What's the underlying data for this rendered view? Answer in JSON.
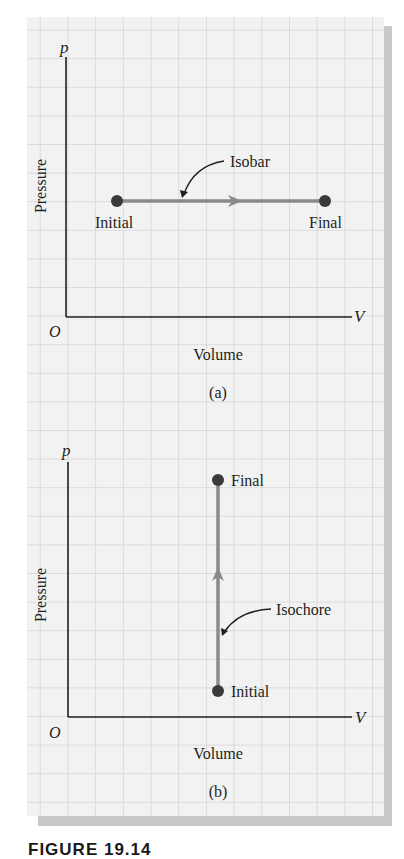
{
  "figure": {
    "caption_partial": "FIGURE 19.14",
    "colors": {
      "paper": "#f2f2f2",
      "grid": "#c8c8c8",
      "shadow": "#c9c9c9",
      "axis": "#231f20",
      "process_line": "#8a8a8a",
      "point": "#3a3a3a"
    }
  },
  "panels": [
    {
      "id": "a",
      "label": "(a)",
      "y_axis_symbol": "p",
      "x_axis_symbol": "V",
      "origin_label": "O",
      "y_axis_title": "Pressure",
      "x_axis_title": "Volume",
      "process_label": "Isobar",
      "initial_label": "Initial",
      "final_label": "Final"
    },
    {
      "id": "b",
      "label": "(b)",
      "y_axis_symbol": "p",
      "x_axis_symbol": "V",
      "origin_label": "O",
      "y_axis_title": "Pressure",
      "x_axis_title": "Volume",
      "process_label": "Isochore",
      "initial_label": "Initial",
      "final_label": "Final"
    }
  ]
}
